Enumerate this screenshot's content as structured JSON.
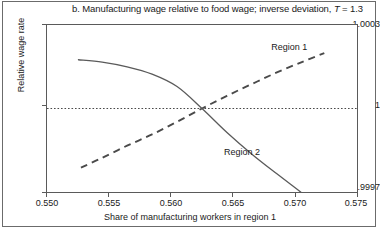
{
  "chart_data": {
    "type": "line",
    "title": "b. Manufacturing wage relative to food wage; inverse deviation, T = 1.3",
    "title_prefix": "b. Manufacturing wage relative to food wage; inverse deviation, ",
    "title_symbol": "T",
    "title_suffix": " = 1.3",
    "xlabel": "Share of manufacturing workers in region 1",
    "ylabel": "Relative wage rate",
    "xlim": [
      0.55,
      0.575
    ],
    "ylim": [
      0.9997,
      1.0003
    ],
    "xticks": [
      "0.550",
      "0.555",
      "0.560",
      "0.565",
      "0.570",
      "0.575"
    ],
    "xtick_values": [
      0.55,
      0.555,
      0.56,
      0.565,
      0.57,
      0.575
    ],
    "yticks": [
      "1.0003",
      "1",
      "0.9997"
    ],
    "ytick_values": [
      1.0003,
      1.0,
      0.9997
    ],
    "grid": false,
    "legend_position": "inline-annotation",
    "reference_line": {
      "y": 1.0,
      "style": "dotted",
      "label": "unity wage ratio"
    },
    "series": [
      {
        "name": "Region 1",
        "style": "dashed",
        "color": "#4a4a4a",
        "label_x": 0.5695,
        "label_y": 1.00022,
        "x": [
          0.5528,
          0.5545,
          0.5565,
          0.5585,
          0.5605,
          0.5625,
          0.5645,
          0.5665,
          0.5685,
          0.5705,
          0.5723
        ],
        "y": [
          0.99979,
          0.999825,
          0.999868,
          0.999908,
          0.999953,
          1.0,
          1.000045,
          1.000087,
          1.000128,
          1.000165,
          1.000197
        ]
      },
      {
        "name": "Region 2",
        "style": "solid",
        "color": "#5a5a5a",
        "label_x": 0.5657,
        "label_y": 0.999846,
        "x": [
          0.5526,
          0.5545,
          0.5565,
          0.5585,
          0.5605,
          0.5625,
          0.5645,
          0.5665,
          0.5685,
          0.5705,
          0.5721
        ],
        "y": [
          1.000173,
          1.000165,
          1.000148,
          1.000122,
          1.000078,
          1.0,
          0.999915,
          0.999838,
          0.999768,
          0.9997,
          0.999643
        ]
      }
    ]
  }
}
